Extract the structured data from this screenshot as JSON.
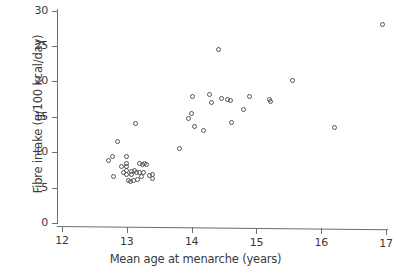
{
  "chart_data": {
    "type": "scatter",
    "title": "",
    "xlabel": "Mean age at menarche (years)",
    "ylabel": "Fibre intake (g/100 kcal/day)",
    "xlim": [
      12,
      17.1
    ],
    "ylim": [
      0,
      30.5
    ],
    "xticks": [
      12,
      13,
      14,
      15,
      16,
      17
    ],
    "xtick_labels": [
      "12",
      "13",
      "14",
      "15",
      "16",
      "17"
    ],
    "yticks": [
      0,
      5,
      10,
      15,
      20,
      25,
      30
    ],
    "ytick_labels": [
      "0",
      "5",
      "10",
      "15",
      "20",
      "25",
      "30"
    ],
    "grid": false,
    "legend": null,
    "marker": "open-circle",
    "marker_color": "#555555",
    "n_points": 52,
    "points": [
      {
        "x": 12.72,
        "y": 8.8
      },
      {
        "x": 12.78,
        "y": 9.4
      },
      {
        "x": 12.8,
        "y": 6.6
      },
      {
        "x": 12.86,
        "y": 11.5
      },
      {
        "x": 12.92,
        "y": 8.0
      },
      {
        "x": 12.95,
        "y": 7.1
      },
      {
        "x": 13.0,
        "y": 9.4
      },
      {
        "x": 13.0,
        "y": 8.4
      },
      {
        "x": 13.0,
        "y": 8.0
      },
      {
        "x": 13.0,
        "y": 7.4
      },
      {
        "x": 13.0,
        "y": 6.9
      },
      {
        "x": 13.02,
        "y": 6.0
      },
      {
        "x": 13.05,
        "y": 5.9
      },
      {
        "x": 13.08,
        "y": 7.3
      },
      {
        "x": 13.08,
        "y": 6.8
      },
      {
        "x": 13.1,
        "y": 6.0
      },
      {
        "x": 13.12,
        "y": 7.4
      },
      {
        "x": 13.14,
        "y": 14.0
      },
      {
        "x": 13.15,
        "y": 7.1
      },
      {
        "x": 13.16,
        "y": 6.1
      },
      {
        "x": 13.2,
        "y": 8.4
      },
      {
        "x": 13.2,
        "y": 7.2
      },
      {
        "x": 13.22,
        "y": 6.6
      },
      {
        "x": 13.24,
        "y": 8.3
      },
      {
        "x": 13.26,
        "y": 7.2
      },
      {
        "x": 13.28,
        "y": 8.4
      },
      {
        "x": 13.3,
        "y": 8.3
      },
      {
        "x": 13.35,
        "y": 6.7
      },
      {
        "x": 13.4,
        "y": 6.8
      },
      {
        "x": 13.4,
        "y": 6.3
      },
      {
        "x": 13.82,
        "y": 10.5
      },
      {
        "x": 13.95,
        "y": 14.8
      },
      {
        "x": 14.0,
        "y": 15.5
      },
      {
        "x": 14.02,
        "y": 17.8
      },
      {
        "x": 14.04,
        "y": 13.7
      },
      {
        "x": 14.18,
        "y": 13.1
      },
      {
        "x": 14.28,
        "y": 18.2
      },
      {
        "x": 14.3,
        "y": 17.0
      },
      {
        "x": 14.42,
        "y": 24.5
      },
      {
        "x": 14.46,
        "y": 17.6
      },
      {
        "x": 14.56,
        "y": 17.5
      },
      {
        "x": 14.6,
        "y": 17.3
      },
      {
        "x": 14.62,
        "y": 14.2
      },
      {
        "x": 14.8,
        "y": 16.1
      },
      {
        "x": 14.9,
        "y": 17.9
      },
      {
        "x": 15.2,
        "y": 17.4
      },
      {
        "x": 15.21,
        "y": 17.2
      },
      {
        "x": 15.55,
        "y": 20.1
      },
      {
        "x": 16.2,
        "y": 13.5
      },
      {
        "x": 16.95,
        "y": 28.0
      }
    ]
  }
}
